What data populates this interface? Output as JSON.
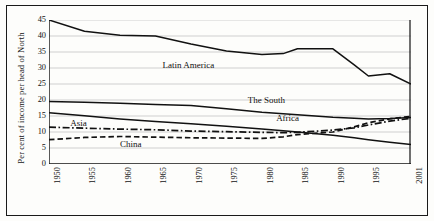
{
  "figure": {
    "y_axis_title": "Per cent of income per head of North",
    "frame_color": "#1a1a1a"
  },
  "chart_data": {
    "type": "line",
    "title": "",
    "subtitle": "",
    "xlabel": "",
    "ylabel": "Per cent of income per head of North",
    "xlim": [
      1950,
      2001
    ],
    "ylim": [
      0,
      45
    ],
    "grid": true,
    "grid_axis": "y",
    "legend_position": "inline-annotations",
    "x_tick_labels": [
      "1950",
      "1955",
      "1960",
      "1965",
      "1970",
      "1975",
      "1980",
      "1985",
      "1990",
      "1995",
      "2001"
    ],
    "x_ticks": [
      1950,
      1955,
      1960,
      1965,
      1970,
      1975,
      1980,
      1985,
      1990,
      1995,
      2001
    ],
    "y_tick_labels": [
      "0",
      "5",
      "10",
      "15",
      "20",
      "25",
      "30",
      "35",
      "40",
      "45"
    ],
    "y_ticks": [
      0,
      5,
      10,
      15,
      20,
      25,
      30,
      35,
      40,
      45
    ],
    "x": [
      1950,
      1955,
      1960,
      1965,
      1970,
      1975,
      1980,
      1983,
      1985,
      1990,
      1993,
      1995,
      1998,
      2001
    ],
    "series": [
      {
        "name": "Latin America",
        "style": "solid",
        "color": "#111111",
        "label_x": 1966,
        "label_y": 30.6,
        "values": [
          45.0,
          41.5,
          40.2,
          40.0,
          37.5,
          35.3,
          34.2,
          34.5,
          36.0,
          36.0,
          31.0,
          27.5,
          28.2,
          25.0
        ]
      },
      {
        "name": "The South",
        "style": "solid",
        "color": "#111111",
        "label_x": 1978,
        "label_y": 19.6,
        "values": [
          19.5,
          19.3,
          19.0,
          18.6,
          18.3,
          17.3,
          16.2,
          15.7,
          15.4,
          14.6,
          14.3,
          14.1,
          14.2,
          14.5
        ]
      },
      {
        "name": "Africa",
        "style": "solid",
        "color": "#111111",
        "label_x": 1982,
        "label_y": 14.0,
        "values": [
          16.0,
          15.1,
          14.1,
          13.3,
          12.6,
          11.8,
          10.9,
          10.4,
          10.0,
          9.0,
          8.2,
          7.6,
          6.8,
          6.1
        ]
      },
      {
        "name": "Asia",
        "style": "dash-dot",
        "color": "#111111",
        "label_x": 1953,
        "label_y": 12.4,
        "values": [
          11.5,
          11.2,
          10.9,
          10.7,
          10.3,
          10.1,
          9.9,
          9.8,
          9.9,
          10.6,
          11.3,
          12.2,
          13.4,
          14.3
        ]
      },
      {
        "name": "China",
        "style": "dashed",
        "color": "#111111",
        "label_x": 1960,
        "label_y": 5.8,
        "values": [
          7.6,
          8.3,
          8.6,
          8.4,
          8.2,
          8.1,
          8.0,
          8.5,
          9.2,
          10.0,
          11.6,
          12.9,
          14.1,
          14.9
        ]
      }
    ]
  }
}
